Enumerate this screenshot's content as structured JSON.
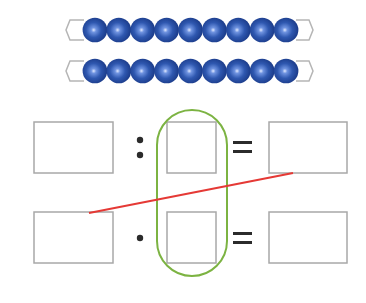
{
  "diagram": {
    "colors": {
      "bead": "#2f58b0",
      "bead_dark": "#1d3f8f",
      "bead_highlight": "#c9d8ff",
      "wire": "#b5b5b5",
      "box_border": "#a8a8a8",
      "oval": "#7cb342",
      "line": "#e53935",
      "symbol": "#2b2b2b",
      "background": "#ffffff"
    },
    "bead_bars": [
      {
        "label": "bead-bar-1",
        "bead_count": 9
      },
      {
        "label": "bead-bar-2",
        "bead_count": 9
      }
    ],
    "equations": [
      {
        "row": 1,
        "operator": ":",
        "operator_name": "division",
        "equals": "="
      },
      {
        "row": 2,
        "operator": "·",
        "operator_name": "multiplication",
        "equals": "="
      }
    ],
    "boxes": {
      "row1": [
        "",
        "",
        ""
      ],
      "row2": [
        "",
        "",
        ""
      ]
    }
  }
}
